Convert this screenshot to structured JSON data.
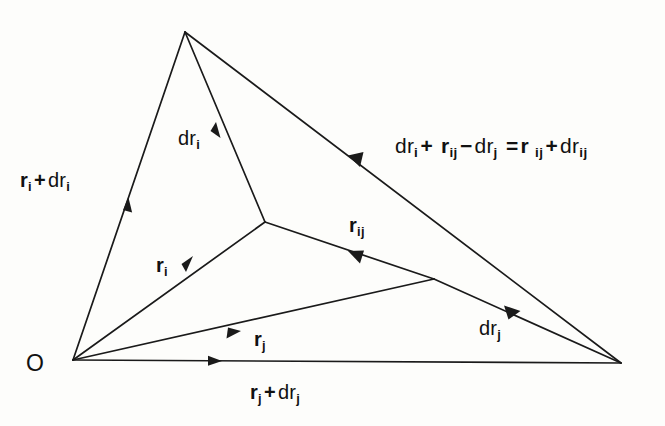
{
  "figure": {
    "type": "vector-diagram",
    "background_color": "#fdfdfb",
    "line_color": "#1a1a1a"
  },
  "labels": {
    "origin": "O",
    "left_side": {
      "base": "r",
      "base_sub": "i",
      "op": "+",
      "second": "dr",
      "second_sub": "i",
      "plain": "r i + dr i"
    },
    "bottom": {
      "base": "r",
      "base_sub": "j",
      "op": "+",
      "second": "dr",
      "second_sub": "j",
      "plain": "r j + dr j"
    },
    "dri": {
      "base": "dr",
      "base_sub": "i",
      "plain": "dr i"
    },
    "drj": {
      "base": "dr",
      "base_sub": "j",
      "plain": "dr j"
    },
    "ri": {
      "base": "r",
      "base_sub": "i",
      "plain": "r i"
    },
    "rj": {
      "base": "r",
      "base_sub": "j",
      "plain": "r j"
    },
    "rij": {
      "base": "r",
      "base_sub": "ij",
      "plain": "r ij"
    },
    "equation": {
      "t1": "dr",
      "t1_sub": "i",
      "op1": "+",
      "t2": "r",
      "t2_sub": "ij",
      "op2": "−",
      "t3": "dr",
      "t3_sub": "j",
      "eq": "=",
      "t4": "r",
      "t4_sub": "ij",
      "op3": "+",
      "t5": "dr",
      "t5_sub": "ij",
      "plain": "dr i + r ij − dr j = r ij + dr ij"
    }
  },
  "geometry": {
    "points": {
      "O": [
        73,
        360
      ],
      "apex": [
        185,
        32
      ],
      "right": [
        621,
        363
      ],
      "mid_i": [
        265,
        222
      ],
      "mid_j": [
        434,
        279
      ]
    },
    "edges": [
      {
        "name": "O-apex",
        "label_ref": "left_side"
      },
      {
        "name": "O-right",
        "label_ref": "bottom"
      },
      {
        "name": "apex-right",
        "label_ref": "equation"
      },
      {
        "name": "O-mid_i",
        "label_ref": "ri"
      },
      {
        "name": "mid_i-apex",
        "label_ref": "dri"
      },
      {
        "name": "mid_i-mid_j",
        "label_ref": "rij"
      },
      {
        "name": "O-mid_j",
        "label_ref": "rj"
      },
      {
        "name": "mid_j-right",
        "label_ref": "drj"
      }
    ]
  }
}
